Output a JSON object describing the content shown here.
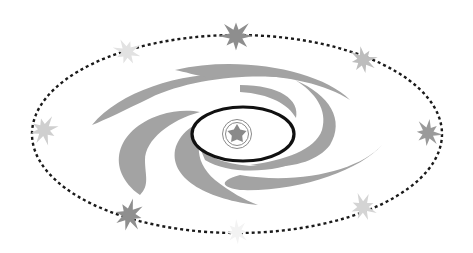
{
  "diagram": {
    "colors": {
      "background": "#ffffff",
      "spiral_arm": "#a3a3a3",
      "orbit_line": "#1a1a1a",
      "core_outline": "#111111",
      "emblem": "#8a8a8a"
    },
    "orbit": {
      "style": "dotted"
    },
    "stars": [
      {
        "name": "top",
        "shade": "#8e8e8e"
      },
      {
        "name": "upper-left",
        "shade": "#e2e2e2"
      },
      {
        "name": "upper-right",
        "shade": "#bdbdbd"
      },
      {
        "name": "right",
        "shade": "#9a9a9a"
      },
      {
        "name": "lower-right",
        "shade": "#d4d4d4"
      },
      {
        "name": "bottom",
        "shade": "#f3f3f3"
      },
      {
        "name": "lower-left",
        "shade": "#8f8f8f"
      },
      {
        "name": "left",
        "shade": "#cfcfcf"
      }
    ],
    "core": {
      "emblem": "star-in-double-circle"
    }
  }
}
